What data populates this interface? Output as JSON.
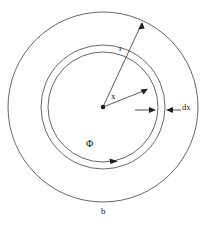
{
  "figure": {
    "background_color": "#ffffff",
    "stroke_color": "#4a4a4a",
    "label_color": "#1a1a1a"
  },
  "geometry": {
    "center_x": 103,
    "center_y": 107,
    "outer_radius": 95,
    "annulus_outer_radius": 62,
    "annulus_inner_radius": 55,
    "center_dot_radius": 2.2
  },
  "labels": {
    "outer_radius_label": "r",
    "inner_radius_label": "x",
    "thickness_label": "dx",
    "flux_label": "Φ",
    "outer_boundary_label": "b"
  },
  "annotations": {
    "r_arrow": {
      "name": "radius-r-arrow",
      "from_x": 103,
      "from_y": 107,
      "to_x": 142,
      "to_y": 22,
      "label": "r"
    },
    "x_arrow": {
      "name": "radius-x-arrow",
      "from_x": 103,
      "from_y": 107,
      "to_x": 147,
      "to_y": 89,
      "label": "x"
    },
    "dx_dimension": {
      "name": "dx-thickness-dimension",
      "left_arrow_tip_x": 155,
      "right_arrow_tip_x": 166,
      "y": 110,
      "label": "dx"
    },
    "phi_direction_arrow": {
      "name": "flux-direction-arrowhead",
      "x": 110,
      "y": 162,
      "direction": "clockwise",
      "label": "Φ"
    }
  }
}
